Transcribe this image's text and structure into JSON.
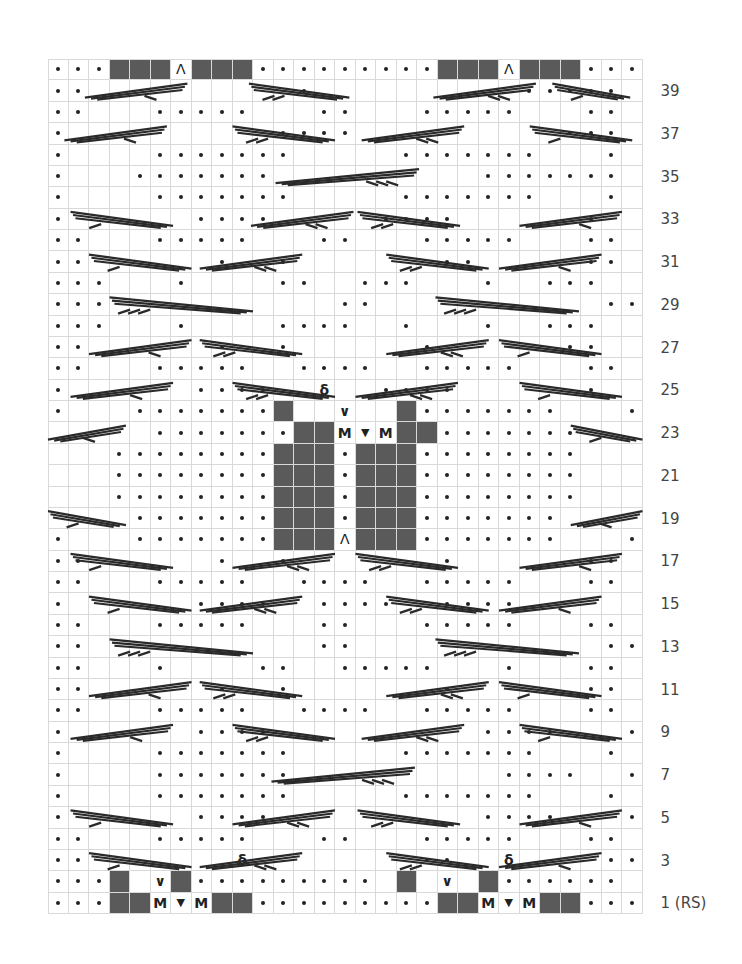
{
  "chart_title": "",
  "grid": {
    "columns": 29,
    "rows_count": 40,
    "cell_w": 20.5,
    "cell_h": 21.375,
    "colors": {
      "grid_line": "#d9d9d9",
      "no_stitch": "#5a5a5a",
      "ink": "#222222",
      "label": "#444444"
    }
  },
  "legend_key": {
    ".": "purl",
    " ": "knit",
    "#": "no stitch",
    "M": "make 1",
    "V": "centered decrease",
    "A": "double decrease",
    "Q": "twisted stitch",
    "O": "yarn over / slip"
  },
  "rows": [
    {
      "n": 40,
      "label": "",
      "cells": "...###A###.........###A###..."
    },
    {
      "n": 39,
      "label": "39",
      "cells": "..          .          ....."
    },
    {
      "n": 38,
      "label": "",
      "cells": "..   .....   ..   .....   .."
    },
    {
      "n": 37,
      "label": "37",
      "cells": ".          ....          ..."
    },
    {
      "n": 36,
      "label": "",
      "cells": ".    .......     .......   ."
    },
    {
      "n": 35,
      "label": "35",
      "cells": ".   .......          ......."
    },
    {
      "n": 34,
      "label": "",
      "cells": ".    .......     .......   ."
    },
    {
      "n": 33,
      "label": "33",
      "cells": ".      ....     ....      ."
    },
    {
      "n": 32,
      "label": "",
      "cells": "..   .....   ..   .....   .."
    },
    {
      "n": 31,
      "label": "31",
      "cells": "..      .  .       ..     .."
    },
    {
      "n": 30,
      "label": "",
      "cells": "...   .    ..  ...   .  ..."
    },
    {
      "n": 29,
      "label": "29",
      "cells": "...           ..           ..."
    },
    {
      "n": 28,
      "label": "",
      "cells": "...   .    ....  .   .  ..."
    },
    {
      "n": 27,
      "label": "27",
      "cells": "..      .  .      .      .."
    },
    {
      "n": 26,
      "label": "",
      "cells": "..   .....  ....  .....   .."
    },
    {
      "n": 25,
      "label": "25",
      "cells": ".      ....  Q  ....      ."
    },
    {
      "n": 24,
      "label": "",
      "cells": ".   .......#  O  #.......   ."
    },
    {
      "n": 23,
      "label": "23",
      "cells": "     .......##MVM##.......    "
    },
    {
      "n": 22,
      "label": "",
      "cells": "   ........###.###........   "
    },
    {
      "n": 21,
      "label": "21",
      "cells": "   ........###.###........   "
    },
    {
      "n": 20,
      "label": "",
      "cells": "   ........###.###........   "
    },
    {
      "n": 19,
      "label": "19",
      "cells": "    .......###.###.......    "
    },
    {
      "n": 18,
      "label": "",
      "cells": ".   .......###A###.......   ."
    },
    {
      "n": 17,
      "label": "17",
      "cells": "..      .  .       .      .."
    },
    {
      "n": 16,
      "label": "",
      "cells": "..   .....  ....  .....   .."
    },
    {
      "n": 15,
      "label": "15",
      "cells": ".      ....  ....  ....      ."
    },
    {
      "n": 14,
      "label": "",
      "cells": "..   .....   ..   .....   .."
    },
    {
      "n": 13,
      "label": "13",
      "cells": "..           ..            .."
    },
    {
      "n": 12,
      "label": "",
      "cells": "..   .    ..  .....   .   .."
    },
    {
      "n": 11,
      "label": "11",
      "cells": "..      .  .       .      .."
    },
    {
      "n": 10,
      "label": "",
      "cells": "..   .....  ....  .....   .."
    },
    {
      "n": 9,
      "label": "9",
      "cells": ".      ....          ....   ."
    },
    {
      "n": 8,
      "label": "",
      "cells": ".    .......     .......   ."
    },
    {
      "n": 7,
      "label": "7",
      "cells": ".    .......          ....  ."
    },
    {
      "n": 6,
      "label": "",
      "cells": ".    .......     .......   ."
    },
    {
      "n": 5,
      "label": "5",
      "cells": ".      ....          ....   ."
    },
    {
      "n": 4,
      "label": "",
      "cells": "..   .....   ..   .....   .."
    },
    {
      "n": 3,
      "label": "3",
      "cells": "..       Q        ..  Q    .."
    },
    {
      "n": 2,
      "label": "",
      "cells": "...# O#......... # O #......"
    },
    {
      "n": 1,
      "label": "1 (RS)",
      "cells": "...##MVM##.........##MVM##..."
    }
  ],
  "cables": [
    {
      "row": 39,
      "from": 1.8,
      "to": 6.8,
      "dir": "up",
      "stub": "single"
    },
    {
      "row": 39,
      "from": 9.8,
      "to": 14.7,
      "dir": "down",
      "stub": "double"
    },
    {
      "row": 39,
      "from": 18.8,
      "to": 23.8,
      "dir": "up",
      "stub": "double"
    },
    {
      "row": 39,
      "from": 24.6,
      "to": 28.4,
      "dir": "down",
      "stub": "single"
    },
    {
      "row": 37,
      "from": 0.8,
      "to": 5.8,
      "dir": "up",
      "stub": "single"
    },
    {
      "row": 37,
      "from": 9.0,
      "to": 14.0,
      "dir": "down",
      "stub": "double"
    },
    {
      "row": 37,
      "from": 15.3,
      "to": 20.3,
      "dir": "up",
      "stub": "double"
    },
    {
      "row": 37,
      "from": 23.5,
      "to": 28.5,
      "dir": "down",
      "stub": "single"
    },
    {
      "row": 35,
      "from": 11.1,
      "to": 18.1,
      "dir": "up",
      "stub": "triple"
    },
    {
      "row": 33,
      "from": 1.1,
      "to": 6.1,
      "dir": "down",
      "stub": "single"
    },
    {
      "row": 33,
      "from": 9.9,
      "to": 14.9,
      "dir": "up",
      "stub": "double"
    },
    {
      "row": 33,
      "from": 15.1,
      "to": 20.1,
      "dir": "down",
      "stub": "double"
    },
    {
      "row": 33,
      "from": 23.0,
      "to": 28.0,
      "dir": "up",
      "stub": "single"
    },
    {
      "row": 31,
      "from": 2.0,
      "to": 7.0,
      "dir": "down",
      "stub": "single"
    },
    {
      "row": 31,
      "from": 7.4,
      "to": 12.4,
      "dir": "up",
      "stub": "double"
    },
    {
      "row": 31,
      "from": 16.5,
      "to": 21.5,
      "dir": "down",
      "stub": "double"
    },
    {
      "row": 31,
      "from": 22.0,
      "to": 27.0,
      "dir": "up",
      "stub": "single"
    },
    {
      "row": 29,
      "from": 3.0,
      "to": 10.0,
      "dir": "down",
      "stub": "triple"
    },
    {
      "row": 29,
      "from": 18.9,
      "to": 25.9,
      "dir": "down",
      "stub": "triple"
    },
    {
      "row": 27,
      "from": 2.0,
      "to": 7.0,
      "dir": "up",
      "stub": "single"
    },
    {
      "row": 27,
      "from": 7.4,
      "to": 12.4,
      "dir": "down",
      "stub": "double"
    },
    {
      "row": 27,
      "from": 16.5,
      "to": 21.5,
      "dir": "up",
      "stub": "double"
    },
    {
      "row": 27,
      "from": 22.0,
      "to": 27.0,
      "dir": "down",
      "stub": "single"
    },
    {
      "row": 25,
      "from": 1.1,
      "to": 6.1,
      "dir": "up",
      "stub": "single"
    },
    {
      "row": 25,
      "from": 9.0,
      "to": 14.0,
      "dir": "down",
      "stub": "double"
    },
    {
      "row": 25,
      "from": 15.0,
      "to": 20.0,
      "dir": "up",
      "stub": "double"
    },
    {
      "row": 25,
      "from": 23.0,
      "to": 28.0,
      "dir": "down",
      "stub": "single"
    },
    {
      "row": 23,
      "from": 0.0,
      "to": 3.8,
      "dir": "up",
      "stub": "single"
    },
    {
      "row": 23,
      "from": 25.5,
      "to": 29.0,
      "dir": "down",
      "stub": "single"
    },
    {
      "row": 19,
      "from": 0.0,
      "to": 3.8,
      "dir": "down",
      "stub": "single"
    },
    {
      "row": 19,
      "from": 25.5,
      "to": 29.0,
      "dir": "up",
      "stub": "single"
    },
    {
      "row": 17,
      "from": 1.1,
      "to": 6.1,
      "dir": "down",
      "stub": "single"
    },
    {
      "row": 17,
      "from": 9.0,
      "to": 14.0,
      "dir": "up",
      "stub": "double"
    },
    {
      "row": 17,
      "from": 15.0,
      "to": 20.0,
      "dir": "down",
      "stub": "double"
    },
    {
      "row": 17,
      "from": 23.0,
      "to": 28.0,
      "dir": "up",
      "stub": "single"
    },
    {
      "row": 15,
      "from": 2.0,
      "to": 7.0,
      "dir": "down",
      "stub": "single"
    },
    {
      "row": 15,
      "from": 7.4,
      "to": 12.4,
      "dir": "up",
      "stub": "double"
    },
    {
      "row": 15,
      "from": 16.5,
      "to": 21.5,
      "dir": "down",
      "stub": "double"
    },
    {
      "row": 15,
      "from": 22.0,
      "to": 27.0,
      "dir": "up",
      "stub": "single"
    },
    {
      "row": 13,
      "from": 3.0,
      "to": 10.0,
      "dir": "down",
      "stub": "triple"
    },
    {
      "row": 13,
      "from": 18.9,
      "to": 25.9,
      "dir": "down",
      "stub": "triple"
    },
    {
      "row": 11,
      "from": 2.0,
      "to": 7.0,
      "dir": "up",
      "stub": "single"
    },
    {
      "row": 11,
      "from": 7.4,
      "to": 12.4,
      "dir": "down",
      "stub": "double"
    },
    {
      "row": 11,
      "from": 16.5,
      "to": 21.5,
      "dir": "up",
      "stub": "double"
    },
    {
      "row": 11,
      "from": 22.0,
      "to": 27.0,
      "dir": "down",
      "stub": "single"
    },
    {
      "row": 9,
      "from": 1.1,
      "to": 6.1,
      "dir": "up",
      "stub": "single"
    },
    {
      "row": 9,
      "from": 9.0,
      "to": 14.0,
      "dir": "down",
      "stub": "double"
    },
    {
      "row": 9,
      "from": 15.3,
      "to": 20.3,
      "dir": "up",
      "stub": "double"
    },
    {
      "row": 9,
      "from": 23.0,
      "to": 28.0,
      "dir": "down",
      "stub": "single"
    },
    {
      "row": 7,
      "from": 10.9,
      "to": 17.9,
      "dir": "up",
      "stub": "triple"
    },
    {
      "row": 5,
      "from": 1.1,
      "to": 6.1,
      "dir": "down",
      "stub": "single"
    },
    {
      "row": 5,
      "from": 9.0,
      "to": 14.0,
      "dir": "up",
      "stub": "double"
    },
    {
      "row": 5,
      "from": 15.1,
      "to": 20.1,
      "dir": "down",
      "stub": "double"
    },
    {
      "row": 5,
      "from": 23.0,
      "to": 28.0,
      "dir": "up",
      "stub": "single"
    },
    {
      "row": 3,
      "from": 2.0,
      "to": 7.0,
      "dir": "down",
      "stub": "single"
    },
    {
      "row": 3,
      "from": 7.4,
      "to": 12.4,
      "dir": "up",
      "stub": "double"
    },
    {
      "row": 3,
      "from": 16.5,
      "to": 21.5,
      "dir": "down",
      "stub": "double"
    },
    {
      "row": 3,
      "from": 22.0,
      "to": 27.0,
      "dir": "up",
      "stub": "single"
    }
  ],
  "row_labels": [
    "39",
    "37",
    "35",
    "33",
    "31",
    "29",
    "27",
    "25",
    "23",
    "21",
    "19",
    "17",
    "15",
    "13",
    "11",
    "9",
    "7",
    "5",
    "3",
    "1 (RS)"
  ]
}
